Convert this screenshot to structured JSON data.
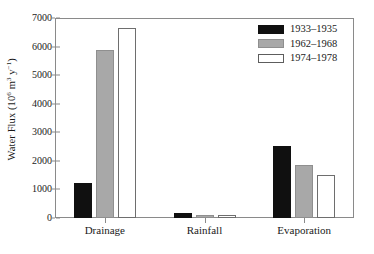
{
  "chart_data": {
    "type": "bar",
    "title": "",
    "xlabel": "",
    "ylabel": "Water Flux (10^6 m^3 y^-1)",
    "ylabel_parts": {
      "prefix": "Water Flux (10",
      "exp1": "6",
      "mid": " m",
      "exp2": "3",
      "mid2": " y",
      "exp3": "−1",
      "suffix": ")"
    },
    "categories": [
      "Drainage",
      "Rainfall",
      "Evaporation"
    ],
    "series": [
      {
        "name": "1933–1935",
        "color": "#101010",
        "values": [
          1225,
          180,
          2520
        ]
      },
      {
        "name": "1962–1968",
        "color": "#a8a8a8",
        "values": [
          5880,
          110,
          1855
        ]
      },
      {
        "name": "1974–1978",
        "color": "#ffffff",
        "values": [
          6650,
          90,
          1505
        ]
      }
    ],
    "ylim": [
      0,
      7000
    ],
    "yticks": [
      0,
      1000,
      2000,
      3000,
      4000,
      5000,
      6000,
      7000
    ],
    "ytick_labels": [
      "0",
      "1000",
      "2000",
      "3000",
      "4000",
      "5000",
      "6000",
      "7000"
    ],
    "grid": false,
    "legend_position": "top-right",
    "frame": "box"
  }
}
